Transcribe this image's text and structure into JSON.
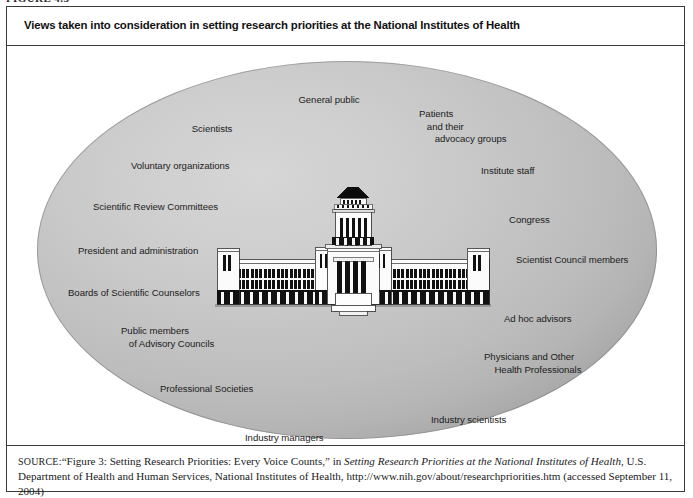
{
  "figure": {
    "number": "FIGURE 4.5",
    "title": "Views taken into consideration in setting research priorities at the National Institutes of Health"
  },
  "source": {
    "label": "SOURCE:",
    "line_full": "SOURCE: “Figure 3: Setting Research Priorities: Every Voice Counts,” in Setting Research Priorities at the National Institutes of Health, U.S. Department of Health and Human Services, National Institutes of Health, http://www.nih.gov/about/researchpriorities.htm (accessed September 11, 2004)",
    "quoted_title": "“Figure 3: Setting Research Priorities: Every Voice Counts,”",
    "in_word": " in ",
    "italic_title": "Setting Research Priorities at the National Institutes of Health",
    "publisher": ", U.S. Department of Health and Human Services, National Institutes of Health, http://www.nih.gov/about/researchpriorities.htm (accessed September 11, 2004)"
  },
  "diagram": {
    "shape": "ellipse",
    "fill_color": "#c4c4c4",
    "center_icon": "capitol-building-icon",
    "labels": [
      {
        "id": "general-public",
        "text": "General public",
        "x": 322,
        "y": 48,
        "align": "center"
      },
      {
        "id": "scientists",
        "text": "Scientists",
        "x": 205,
        "y": 77,
        "align": "center"
      },
      {
        "id": "patients-advocacy",
        "text": "Patients\n   and their\n      advocacy groups",
        "x": 412,
        "y": 62,
        "align": "left"
      },
      {
        "id": "voluntary-orgs",
        "text": "Voluntary organizations",
        "x": 124,
        "y": 114,
        "align": "left"
      },
      {
        "id": "institute-staff",
        "text": "Institute staff",
        "x": 474,
        "y": 119,
        "align": "left"
      },
      {
        "id": "scientific-review",
        "text": "Scientific Review Committees",
        "x": 86,
        "y": 155,
        "align": "left"
      },
      {
        "id": "congress",
        "text": "Congress",
        "x": 502,
        "y": 168,
        "align": "left"
      },
      {
        "id": "president-admin",
        "text": "President and administration",
        "x": 71,
        "y": 199,
        "align": "left"
      },
      {
        "id": "scientist-council",
        "text": "Scientist Council members",
        "x": 509,
        "y": 208,
        "align": "left"
      },
      {
        "id": "boards-counselors",
        "text": "Boards of Scientific Counselors",
        "x": 61,
        "y": 241,
        "align": "left"
      },
      {
        "id": "ad-hoc-advisors",
        "text": "Ad hoc advisors",
        "x": 497,
        "y": 267,
        "align": "left"
      },
      {
        "id": "public-members",
        "text": "Public members\n   of Advisory Councils",
        "x": 114,
        "y": 279,
        "align": "left"
      },
      {
        "id": "physicians-health",
        "text": "Physicians and Other\n    Health Professionals",
        "x": 477,
        "y": 305,
        "align": "left"
      },
      {
        "id": "professional-societies",
        "text": "Professional Societies",
        "x": 153,
        "y": 337,
        "align": "left"
      },
      {
        "id": "industry-scientists",
        "text": "Industry scientists",
        "x": 424,
        "y": 368,
        "align": "left"
      },
      {
        "id": "industry-managers",
        "text": "Industry managers",
        "x": 238,
        "y": 386,
        "align": "left"
      }
    ]
  }
}
